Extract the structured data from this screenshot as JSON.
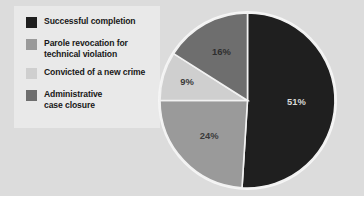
{
  "figure": {
    "panel_bg": "#dcdcdc",
    "legend_bg": "#e9e9e9",
    "page_bg": "#ffffff"
  },
  "legend": {
    "items": [
      {
        "label": "Successful completion",
        "color": "#1f1f1f"
      },
      {
        "label": "Parole revocation for\ntechnical violation",
        "color": "#9a9a9a"
      },
      {
        "label": "Convicted of a new crime",
        "color": "#cfcfcf"
      },
      {
        "label": "Administrative\ncase closure",
        "color": "#6e6e6e"
      }
    ]
  },
  "chart_data": {
    "type": "pie",
    "title": "",
    "subtitle": "",
    "xlabel": "",
    "ylabel": "",
    "legend_position": "left",
    "grid": false,
    "start_angle_deg": 0,
    "direction": "clockwise",
    "categories": [
      "Successful completion",
      "Parole revocation for technical violation",
      "Convicted of a new crime",
      "Administrative case closure"
    ],
    "values": [
      51,
      24,
      9,
      16
    ],
    "labels": [
      "51%",
      "24%",
      "9%",
      "16%"
    ],
    "colors": [
      "#1f1f1f",
      "#9a9a9a",
      "#cfcfcf",
      "#6e6e6e"
    ],
    "label_colors": [
      "#d8d8d8",
      "#3a3a3a",
      "#3a3a3a",
      "#2e2e2e"
    ],
    "slice_separator_color": "#f2f2f2",
    "outline_color": "#f6f6f6",
    "units": "percent",
    "total": 100
  },
  "slice_labels": {
    "s0": "51%",
    "s1": "24%",
    "s2": "9%",
    "s3": "16%"
  }
}
